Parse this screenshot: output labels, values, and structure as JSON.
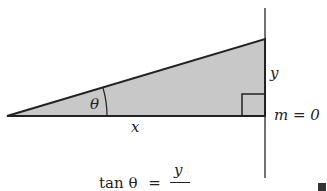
{
  "diagram": {
    "labels": {
      "angle": "θ",
      "adjacent": "x",
      "opposite": "y",
      "slope": "m = 0"
    },
    "equation": {
      "lhs": "tan θ",
      "equals": "=",
      "numerator": "y",
      "denominator": "x"
    },
    "colors": {
      "fill": "#c8c8c8",
      "stroke": "#222222",
      "line": "#444444"
    }
  }
}
